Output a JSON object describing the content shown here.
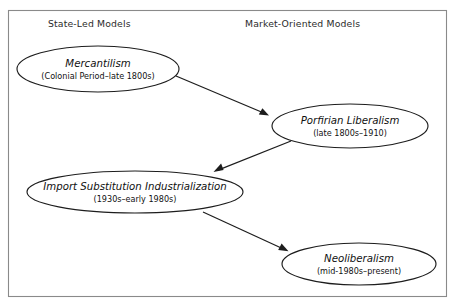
{
  "figure": {
    "background_color": "#ffffff",
    "border_color": "#8a8a8a",
    "line_color": "#1d1d1d"
  },
  "headers": {
    "left": "State-Led Models",
    "right": "Market-Oriented Models"
  },
  "nodes": [
    {
      "id": "mercantilism",
      "title": "Mercantilism",
      "period": "(Colonial Period–late 1800s)",
      "column": "state-led",
      "cx": 98,
      "cy": 69,
      "rx": 81,
      "ry": 23
    },
    {
      "id": "porfirian-liberalism",
      "title": "Porfirian Liberalism",
      "period": "(late 1800s–1910)",
      "column": "market-oriented",
      "cx": 350,
      "cy": 126,
      "rx": 78,
      "ry": 22
    },
    {
      "id": "import-substitution-industrialization",
      "title": "Import Substitution Industrialization",
      "period": "(1930s–early 1980s)",
      "column": "state-led",
      "cx": 135,
      "cy": 192,
      "rx": 108,
      "ry": 21
    },
    {
      "id": "neoliberalism",
      "title": "Neoliberalism",
      "period": "(mid-1980s–present)",
      "column": "market-oriented",
      "cx": 359,
      "cy": 264,
      "rx": 77,
      "ry": 21
    }
  ],
  "edges": [
    {
      "id": "mercantilism-to-porfirian",
      "from": "mercantilism",
      "to": "porfirian-liberalism",
      "x1": 176,
      "y1": 76,
      "x2": 269,
      "y2": 115
    },
    {
      "id": "porfirian-to-isi",
      "from": "porfirian-liberalism",
      "to": "import-substitution-industrialization",
      "x1": 291,
      "y1": 141,
      "x2": 214,
      "y2": 172
    },
    {
      "id": "isi-to-neoliberalism",
      "from": "import-substitution-industrialization",
      "to": "neoliberalism",
      "x1": 203,
      "y1": 212,
      "x2": 288,
      "y2": 251
    }
  ]
}
